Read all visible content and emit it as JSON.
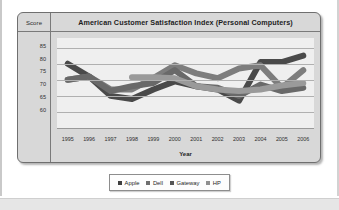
{
  "chart_data": {
    "type": "line",
    "title": "American Customer Satisfaction Index (Personal Computers)",
    "xlabel": "Year",
    "ylabel": "Score",
    "categories": [
      "1995",
      "1996",
      "1997",
      "1998",
      "1999",
      "2000",
      "2001",
      "2002",
      "2003",
      "2004",
      "2005",
      "2006"
    ],
    "ylim": [
      60,
      88
    ],
    "yticks": [
      85,
      80,
      75,
      70,
      65,
      60
    ],
    "grid": true,
    "legend_position": "bottom",
    "series": [
      {
        "name": "Apple",
        "color": "#4a4a4a",
        "values": [
          80,
          76,
          70,
          69,
          72,
          74.5,
          73,
          72,
          68.5,
          80.5,
          80.5,
          82.5
        ]
      },
      {
        "name": "Dell",
        "color": "#7d7d7d",
        "values": [
          75,
          76,
          72,
          72,
          75.5,
          79.5,
          77,
          75.5,
          78.5,
          79.5,
          72.5,
          78
        ]
      },
      {
        "name": "Gateway",
        "color": "#696969",
        "values": [
          75,
          76,
          71.5,
          73,
          74,
          78,
          73,
          72.5,
          70,
          73.5,
          71.5,
          72.5
        ]
      },
      {
        "name": "HP",
        "color": "#9a9a9a",
        "values": [
          null,
          null,
          null,
          75.8,
          75.8,
          75.5,
          73,
          72,
          71.5,
          72,
          73.2,
          74
        ]
      }
    ]
  },
  "legend": {
    "items": [
      {
        "label": "Apple",
        "color": "#3f3f3f"
      },
      {
        "label": "Dell",
        "color": "#6e6e6e"
      },
      {
        "label": "Gateway",
        "color": "#555555"
      },
      {
        "label": "HP",
        "color": "#8f8f8f"
      }
    ]
  }
}
